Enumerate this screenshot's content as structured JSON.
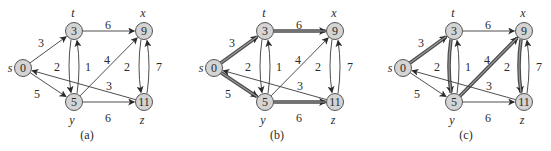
{
  "figure": {
    "colors": {
      "node_fill": "#d4d4d4",
      "node_stroke": "#555555",
      "edge": "#3a3a3a",
      "highlight_outer": "#4a4a4a",
      "highlight_inner": "#9a9a9a",
      "text": "#2a2a2a"
    },
    "vertices": [
      {
        "id": "s",
        "name": "s",
        "d": "0",
        "x": 23,
        "y": 68,
        "lx": -13,
        "ly": 4
      },
      {
        "id": "t",
        "name": "t",
        "d": "3",
        "x": 74,
        "y": 31,
        "lx": -1,
        "ly": -14
      },
      {
        "id": "x",
        "name": "x",
        "d": "9",
        "x": 144,
        "y": 31,
        "lx": -1,
        "ly": -14
      },
      {
        "id": "y",
        "name": "y",
        "d": "5",
        "x": 74,
        "y": 102,
        "lx": -2,
        "ly": 22
      },
      {
        "id": "z",
        "name": "z",
        "d": "11",
        "x": 144,
        "y": 102,
        "lx": -2,
        "ly": 22
      }
    ],
    "edges": [
      {
        "id": "s-t",
        "from": "s",
        "to": "t",
        "w": "3",
        "curve": 0,
        "wx": 41,
        "wy": 43
      },
      {
        "id": "s-y",
        "from": "s",
        "to": "y",
        "w": "5",
        "curve": 0,
        "wx": 37,
        "wy": 94
      },
      {
        "id": "t-x",
        "from": "t",
        "to": "x",
        "w": "6",
        "curve": 0,
        "wx": 108,
        "wy": 25
      },
      {
        "id": "t-y",
        "from": "t",
        "to": "y",
        "w": "2",
        "curve": -7,
        "wx": 57,
        "wy": 67
      },
      {
        "id": "y-t",
        "from": "y",
        "to": "t",
        "w": "1",
        "curve": -7,
        "wx": 88,
        "wy": 67
      },
      {
        "id": "y-x",
        "from": "y",
        "to": "x",
        "w": "4",
        "curve": 0,
        "wx": 107,
        "wy": 60
      },
      {
        "id": "y-z",
        "from": "y",
        "to": "z",
        "w": "6",
        "curve": 0,
        "wx": 108,
        "wy": 118
      },
      {
        "id": "x-z",
        "from": "x",
        "to": "z",
        "w": "2",
        "curve": -7,
        "wx": 127,
        "wy": 67
      },
      {
        "id": "z-x",
        "from": "z",
        "to": "x",
        "w": "7",
        "curve": -7,
        "wx": 159,
        "wy": 67
      },
      {
        "id": "z-s",
        "from": "z",
        "to": "s",
        "w": "3",
        "curve": 0,
        "wx": 109,
        "wy": 86
      }
    ],
    "panels": [
      {
        "id": "a",
        "caption": "(a)",
        "offset_x": 0,
        "caption_x": 87,
        "highlight": []
      },
      {
        "id": "b",
        "caption": "(b)",
        "offset_x": 191,
        "caption_x": 86,
        "highlight": [
          "s-t",
          "t-x",
          "s-y",
          "y-z"
        ]
      },
      {
        "id": "c",
        "caption": "(c)",
        "offset_x": 380,
        "caption_x": 86,
        "highlight": [
          "s-t",
          "t-y",
          "y-x",
          "x-z"
        ]
      }
    ],
    "caption_y": 139
  }
}
